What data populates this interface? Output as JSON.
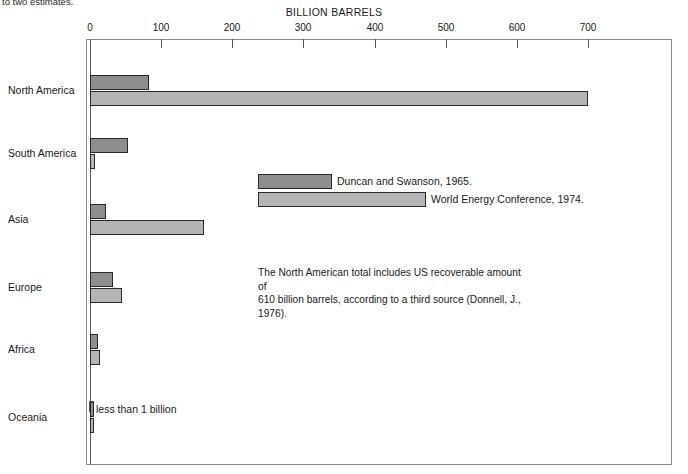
{
  "clipped_top_text": "to two estimates.",
  "chart_data": {
    "type": "bar",
    "orientation": "horizontal",
    "title": "BILLION BARRELS",
    "xlabel": "BILLION BARRELS",
    "ylabel": "",
    "xlim": [
      0,
      820
    ],
    "xticks": [
      0,
      100,
      200,
      300,
      400,
      500,
      600,
      700
    ],
    "xticklabels": [
      "0",
      "100",
      "200",
      "300",
      "400",
      "500",
      "600",
      "700"
    ],
    "grid": false,
    "legend_position": "inside-upper-middle",
    "categories": [
      "North America",
      "South America",
      "Asia",
      "Europe",
      "Africa",
      "Oceania"
    ],
    "series": [
      {
        "name": "Duncan and Swanson, 1965.",
        "color": "#8e8e8e",
        "values": [
          83,
          54,
          22,
          32,
          11,
          0.5
        ]
      },
      {
        "name": "World Energy Conference, 1974.",
        "color": "#b4b4b4",
        "values": [
          700,
          7,
          160,
          45,
          14,
          0.5
        ]
      }
    ],
    "annotations": [
      {
        "name": "oceania-less-than-one",
        "text": "less than 1 billion",
        "category": "Oceania"
      },
      {
        "name": "north-america-third-source-note",
        "text": "The North American total includes US recoverable amount of 610 billion barrels, according to a third source (Donnell, J., 1976)."
      }
    ]
  },
  "note_lines": [
    "The North American total includes US recoverable amount of",
    "610 billion barrels, according to a third source (Donnell, J.,",
    "1976)."
  ],
  "oceania_note": "less than 1 billion",
  "colors": {
    "series_1": "#8e8e8e",
    "series_2": "#b4b4b4",
    "bar_outline": "#2a2a2a",
    "frame": "#8c8c8c",
    "text": "#1a1a1a",
    "background": "#ffffff"
  }
}
